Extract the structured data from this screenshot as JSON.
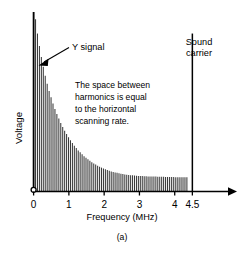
{
  "figure": {
    "caption": "(a)",
    "colors": {
      "line": "#000000",
      "harmonic": "#3a3a3a",
      "background": "#ffffff"
    }
  },
  "annotations": {
    "y_signal": "Y signal",
    "sound_carrier_line1": "Sound",
    "sound_carrier_line2": "carrier",
    "note_line1": "The space between",
    "note_line2": "harmonics is equal",
    "note_line3": "to the horizontal",
    "note_line4": "scanning rate."
  },
  "chart_data": {
    "type": "bar",
    "title": "",
    "subtitle": "",
    "xlabel": "Frequency (MHz)",
    "ylabel": "Voltage",
    "xlim": [
      0,
      5.0
    ],
    "ylim": [
      0,
      100
    ],
    "grid": false,
    "legend": null,
    "xticks": [
      0,
      1,
      2,
      3,
      4,
      4.5
    ],
    "xticklabels": [
      "0",
      "1",
      "2",
      "3",
      "4",
      "4.5"
    ],
    "yticks": [],
    "yticklabels": [],
    "axis_arrow_x": true,
    "axis_arrow_y": false,
    "origin_marker": "open-circle",
    "series": [
      {
        "name": "Y signal harmonics",
        "description": "Luminance signal harmonics spaced at the horizontal scanning rate, decaying exponentially",
        "x": [
          0.0,
          0.055,
          0.11,
          0.165,
          0.22,
          0.275,
          0.33,
          0.385,
          0.44,
          0.495,
          0.55,
          0.605,
          0.66,
          0.715,
          0.77,
          0.825,
          0.88,
          0.935,
          0.99,
          1.045,
          1.1,
          1.155,
          1.21,
          1.265,
          1.32,
          1.375,
          1.43,
          1.485,
          1.54,
          1.595,
          1.65,
          1.705,
          1.76,
          1.815,
          1.87,
          1.925,
          1.98,
          2.035,
          2.09,
          2.145,
          2.2,
          2.255,
          2.31,
          2.365,
          2.42,
          2.475,
          2.53,
          2.585,
          2.64,
          2.695,
          2.75,
          2.805,
          2.86,
          2.915,
          2.97,
          3.025,
          3.08,
          3.135,
          3.19,
          3.245,
          3.3,
          3.355,
          3.41,
          3.465,
          3.52,
          3.575,
          3.63,
          3.685,
          3.74,
          3.795,
          3.85,
          3.905,
          3.96,
          4.015,
          4.07,
          4.125,
          4.18,
          4.235,
          4.29,
          4.345
        ],
        "values": [
          100.0,
          96.0,
          88.0,
          81.0,
          75.0,
          69.5,
          64.5,
          60.0,
          56.0,
          52.5,
          49.0,
          46.0,
          43.2,
          40.6,
          38.2,
          36.0,
          33.9,
          32.0,
          30.2,
          28.5,
          27.0,
          25.5,
          24.2,
          22.9,
          21.8,
          20.7,
          19.7,
          18.8,
          17.9,
          17.1,
          16.3,
          15.6,
          15.0,
          14.4,
          13.8,
          13.3,
          12.8,
          12.4,
          12.0,
          11.6,
          11.2,
          10.9,
          10.6,
          10.4,
          10.1,
          9.9,
          9.7,
          9.5,
          9.4,
          9.2,
          9.1,
          9.0,
          8.9,
          8.8,
          8.7,
          8.6,
          8.6,
          8.5,
          8.5,
          8.4,
          8.4,
          8.3,
          8.3,
          8.3,
          8.2,
          8.2,
          8.2,
          8.2,
          8.1,
          8.1,
          8.1,
          8.1,
          8.1,
          8.0,
          8.0,
          8.0,
          8.0,
          8.0,
          8.0,
          8.0
        ]
      },
      {
        "name": "Sound carrier",
        "description": "Single carrier spike at 4.5 MHz",
        "x": [
          4.5
        ],
        "values": [
          88.0
        ]
      }
    ]
  }
}
